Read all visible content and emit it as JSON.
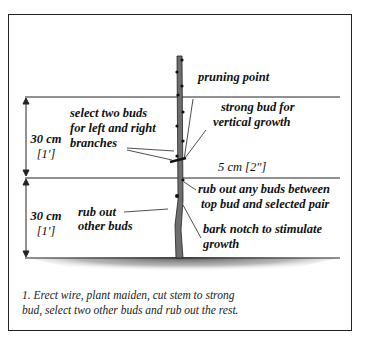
{
  "figure": {
    "labels": {
      "pruning_point": "pruning point",
      "select_buds": [
        "select two buds",
        "for left and right",
        "branches"
      ],
      "strong_bud": [
        "strong bud for",
        "vertical growth"
      ],
      "gap": "5 cm [2″]",
      "rub_out_between": [
        "rub out any buds between",
        "top bud and selected pair"
      ],
      "rub_out_other": [
        "rub out",
        "other buds"
      ],
      "bark_notch": [
        "bark notch to stimulate",
        "growth"
      ]
    },
    "dimensions": {
      "upper": [
        "30 cm",
        "[1′]"
      ],
      "lower": [
        "30 cm",
        "[1′]"
      ]
    },
    "caption": [
      "1.  Erect wire, plant maiden, cut stem to strong",
      "bud, select two other buds and rub out the rest."
    ],
    "colors": {
      "ink": "#1a1a1a",
      "stem": "#6e6e6e",
      "soil": "#8a8a8a"
    }
  }
}
